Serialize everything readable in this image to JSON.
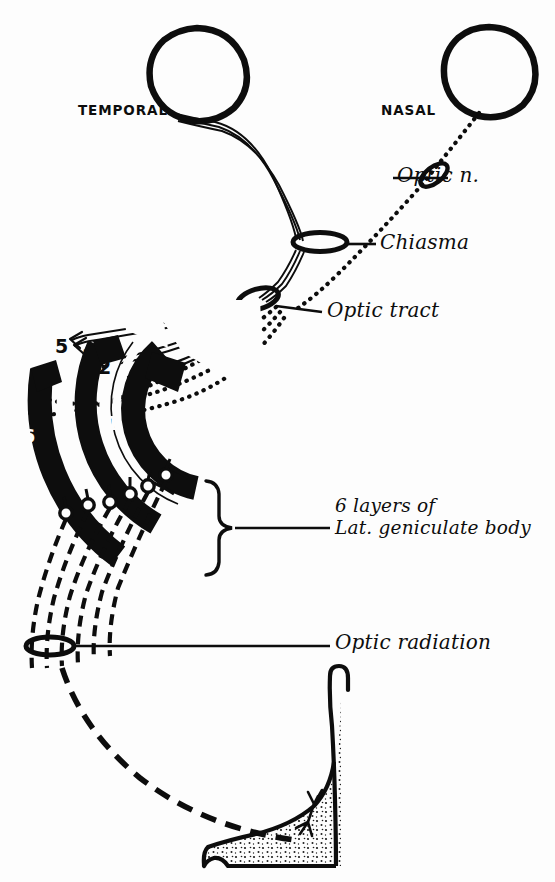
{
  "figure": {
    "background_color": "#fdfdfd",
    "ink_color": "#0d0d0d",
    "width": 555,
    "height": 882
  },
  "field_labels": {
    "temporal": "TEMPORAL",
    "nasal": "NASAL"
  },
  "structure_labels": {
    "optic_nerve": "Optic n.",
    "chiasma": "Chiasma",
    "optic_tract": "Optic tract",
    "geniculate_line1": "6 layers of",
    "geniculate_line2": "Lat. geniculate body",
    "optic_radiation": "Optic radiation"
  },
  "lgn_layers": [
    {
      "number": "1",
      "fill": "black",
      "label_color": "#fdfdfd",
      "x": 106,
      "y": 412
    },
    {
      "number": "2",
      "fill": "white",
      "label_color": "#0d0d0d",
      "x": 98,
      "y": 356
    },
    {
      "number": "3",
      "fill": "white",
      "label_color": "#0d0d0d",
      "x": 82,
      "y": 345
    },
    {
      "number": "4",
      "fill": "black",
      "label_color": "#fdfdfd",
      "x": 60,
      "y": 428
    },
    {
      "number": "5",
      "fill": "white",
      "label_color": "#0d0d0d",
      "x": 55,
      "y": 335
    },
    {
      "number": "6",
      "fill": "black",
      "label_color": "#fdfdfd",
      "x": 22,
      "y": 425
    }
  ],
  "legend_notes": {
    "crossed_fibers_style": "dotted",
    "uncrossed_fibers_style": "solid",
    "radiation_fibers_style": "dashed"
  }
}
